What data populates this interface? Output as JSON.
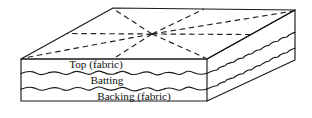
{
  "figure": {
    "name": "quilt-layer-cross-section",
    "background_color": "#ffffff",
    "line_color": "#1a1a1a",
    "stitch_color": "#222222"
  },
  "labels": {
    "top": "Top (fabric)",
    "middle": "Batting",
    "bottom": "Backing (fabric)"
  },
  "layers": [
    {
      "id": "top-layer",
      "label": "Top (fabric)",
      "order": 1
    },
    {
      "id": "batting-layer",
      "label": "Batting",
      "order": 2
    },
    {
      "id": "backing-layer",
      "label": "Backing (fabric)",
      "order": 3
    }
  ],
  "geometry": {
    "top_face": {
      "front_left": [
        21,
        59
      ],
      "back_left": [
        113,
        8
      ],
      "back_right": [
        295,
        10
      ],
      "front_right": [
        207,
        59
      ]
    },
    "front_face": {
      "left": 21,
      "right": 207,
      "top": 59,
      "bottom": 101
    },
    "side_face": {
      "near_top": [
        207,
        59
      ],
      "far_top": [
        295,
        10
      ],
      "far_bottom": [
        295,
        60
      ],
      "near_bottom": [
        207,
        101
      ]
    },
    "stitch_center": [
      152,
      34
    ]
  },
  "stitching": {
    "pattern": "radiating-dashed-lines",
    "dash_array": "5.5 3.8",
    "ray_count": 8
  }
}
